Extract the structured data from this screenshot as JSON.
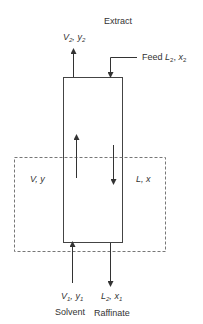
{
  "diagram": {
    "title": "Extract",
    "top_stream": {
      "var": "V",
      "sub": "2",
      "comp": "y",
      "comp_sub": "2"
    },
    "feed": {
      "label": "Feed",
      "var": "L",
      "sub": "2",
      "comp": "x",
      "comp_sub": "2"
    },
    "inner_left": {
      "var": "V",
      "comp": "y"
    },
    "inner_right": {
      "var": "L",
      "comp": "x"
    },
    "bottom_left": {
      "var": "V",
      "sub": "1",
      "comp": "y",
      "comp_sub": "1",
      "name": "Solvent"
    },
    "bottom_right": {
      "var": "L",
      "sub": "2",
      "comp": "x",
      "comp_sub": "1",
      "name": "Raffinate"
    },
    "colors": {
      "line": "#444444",
      "dashed": "#777777"
    }
  }
}
